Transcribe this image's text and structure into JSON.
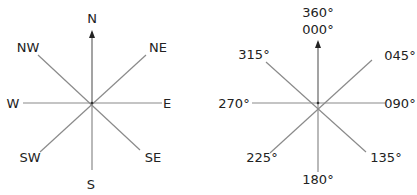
{
  "diagram": {
    "colors": {
      "line": "#8a8a8a",
      "axis": "#666666",
      "text": "#222222",
      "background": "#ffffff"
    },
    "compass_points": {
      "N": "N",
      "NE": "NE",
      "E": "E",
      "SE": "SE",
      "S": "S",
      "SW": "SW",
      "W": "W",
      "NW": "NW"
    },
    "bearings": {
      "north_top": "360°",
      "north_bottom": "000°",
      "ne": "045°",
      "e": "090°",
      "se": "135°",
      "s": "180°",
      "sw": "225°",
      "w": "270°",
      "nw": "315°"
    }
  }
}
